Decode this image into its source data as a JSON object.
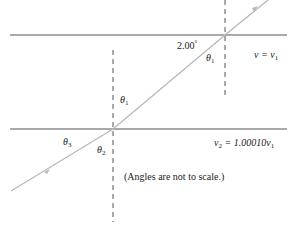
{
  "diagram": {
    "type": "refraction through layered media",
    "boundary_upper": {
      "label_velocity": "v = v",
      "label_sub": "1"
    },
    "boundary_lower": {
      "label_velocity": "v",
      "label_sub_v": "2",
      "label_eq": " = 1.00010v",
      "label_sub": "1"
    },
    "angle_label": {
      "value": "2.00",
      "unit": "°"
    },
    "thetas": [
      {
        "symbol": "θ",
        "sub": "1",
        "position": "upper-right below upper boundary"
      },
      {
        "symbol": "θ",
        "sub": "1",
        "position": "left of middle normal, above lower boundary"
      },
      {
        "symbol": "θ",
        "sub": "2",
        "position": "below lower boundary, left of normal"
      },
      {
        "symbol": "θ",
        "sub": "3",
        "position": "below lower boundary, far left"
      }
    ],
    "note": "(Angles are not to scale.)",
    "colors": {
      "ray": "#b8b8b8",
      "boundary": "#555555",
      "normal": "#555555",
      "text": "#222222"
    }
  }
}
